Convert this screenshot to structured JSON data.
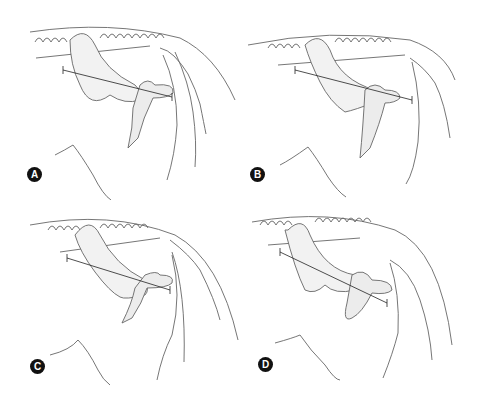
{
  "figure": {
    "panels": [
      {
        "label": "A"
      },
      {
        "label": "B"
      },
      {
        "label": "C"
      },
      {
        "label": "D"
      }
    ]
  },
  "colors": {
    "line": "#555555",
    "bone_fill": "#f2f2f2",
    "bone_shade": "#bdbdbd",
    "badge": "#111111"
  }
}
